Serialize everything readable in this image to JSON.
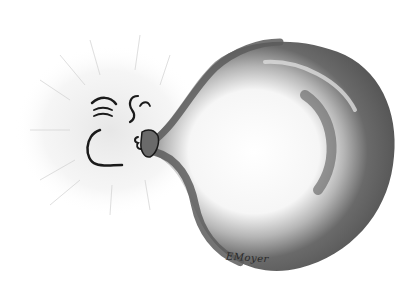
{
  "illustration": {
    "subject": "face blowing up a large balloon",
    "style": "grey watercolor with black ink outlines",
    "signature": "EMoyer",
    "colors": {
      "background": "#ffffff",
      "balloon_dark": "#5a5a5a",
      "balloon_mid": "#8a8a8a",
      "balloon_light": "#f4f4f4",
      "ink": "#1a1a1a",
      "aura": "#d8d8d8"
    }
  }
}
